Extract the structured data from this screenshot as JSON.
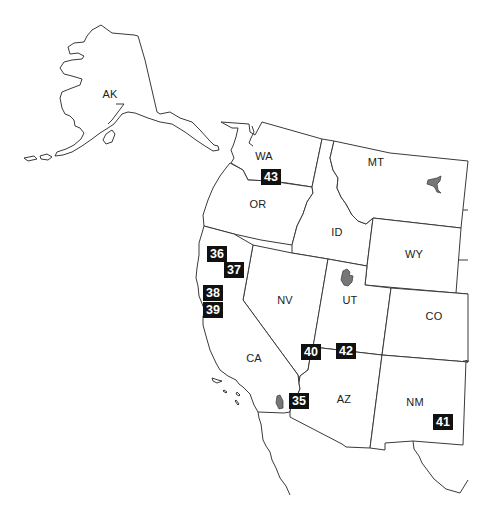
{
  "map": {
    "title": "Western United States",
    "states": [
      {
        "code": "AK",
        "x": 110,
        "y": 94
      },
      {
        "code": "WA",
        "x": 264,
        "y": 156
      },
      {
        "code": "OR",
        "x": 258,
        "y": 204
      },
      {
        "code": "MT",
        "x": 376,
        "y": 162
      },
      {
        "code": "ID",
        "x": 337,
        "y": 232
      },
      {
        "code": "WY",
        "x": 414,
        "y": 254
      },
      {
        "code": "NV",
        "x": 285,
        "y": 300
      },
      {
        "code": "UT",
        "x": 350,
        "y": 300
      },
      {
        "code": "CO",
        "x": 434,
        "y": 316
      },
      {
        "code": "CA",
        "x": 254,
        "y": 358
      },
      {
        "code": "AZ",
        "x": 344,
        "y": 399
      },
      {
        "code": "NM",
        "x": 415,
        "y": 402
      }
    ],
    "markers": [
      {
        "id": "35",
        "x": 299,
        "y": 401
      },
      {
        "id": "36",
        "x": 217,
        "y": 254
      },
      {
        "id": "37",
        "x": 234,
        "y": 270
      },
      {
        "id": "38",
        "x": 213,
        "y": 293
      },
      {
        "id": "39",
        "x": 213,
        "y": 310
      },
      {
        "id": "40",
        "x": 311,
        "y": 352
      },
      {
        "id": "41",
        "x": 443,
        "y": 422
      },
      {
        "id": "42",
        "x": 346,
        "y": 351
      },
      {
        "id": "43",
        "x": 271,
        "y": 177
      }
    ],
    "colors": {
      "outline": "#3a3a3a",
      "marker_bg": "#111111",
      "marker_text": "#ffffff",
      "lake": "#777777",
      "background": "#ffffff"
    }
  }
}
